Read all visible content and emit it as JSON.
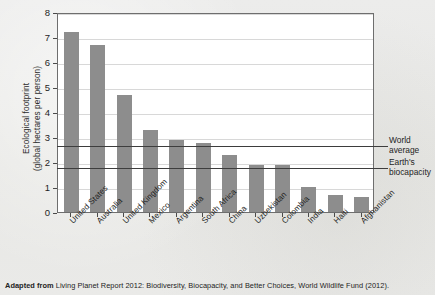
{
  "chart_data": {
    "type": "bar",
    "title": "",
    "xlabel": "",
    "ylabel": "Ecological footprint (global hectares per person)",
    "ylabel_line1": "Ecological footprint",
    "ylabel_line2": "(global hectares per person)",
    "ylim": [
      0,
      8
    ],
    "ytick_labels": [
      "0",
      "1",
      "2",
      "3",
      "4",
      "5",
      "6",
      "7",
      "8"
    ],
    "ytick_values": [
      0,
      1,
      2,
      3,
      4,
      5,
      6,
      7,
      8
    ],
    "grid": true,
    "legend": "none",
    "bar_color": "#8d8d8d",
    "categories": [
      "United States",
      "Australia",
      "United Kingdom",
      "Mexico",
      "Argentina",
      "South Africa",
      "China",
      "Uzbekistan",
      "Colombia",
      "India",
      "Haiti",
      "Afghanistan"
    ],
    "values": [
      7.2,
      6.7,
      4.7,
      3.3,
      2.9,
      2.75,
      2.3,
      1.9,
      1.9,
      1.0,
      0.7,
      0.6
    ],
    "reference_lines": [
      {
        "label": "World average",
        "label_line1": "World",
        "label_line2": "average",
        "value": 2.7
      },
      {
        "label": "Earth's biocapacity",
        "label_line1": "Earth's",
        "label_line2": "biocapacity",
        "value": 1.8
      }
    ]
  },
  "caption": {
    "prefix": "Adapted from",
    "source": "Living Planet Report 2012: Biodiversity, Biocapacity, and Better Choices, World Wildlife Fund (2012)."
  }
}
